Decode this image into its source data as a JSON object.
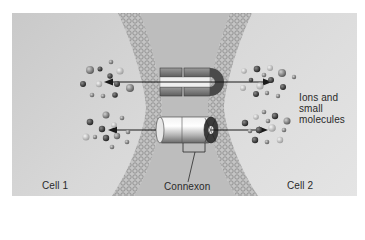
{
  "figure": {
    "labels": {
      "cell1": "Cell 1",
      "cell2": "Cell 2",
      "ions_line1": "Ions and",
      "ions_line2": "small",
      "ions_line3": "molecules",
      "connexon": "Connexon"
    },
    "components": [
      {
        "name": "left-membrane",
        "type": "lipid-bilayer"
      },
      {
        "name": "right-membrane",
        "type": "lipid-bilayer"
      },
      {
        "name": "open-channel",
        "type": "connexon-pair-cutaway"
      },
      {
        "name": "connexon-cylinder",
        "type": "connexon-pair"
      }
    ],
    "arrows": [
      {
        "from": "channel-top",
        "direction": "bidirectional"
      },
      {
        "from": "channel-bottom",
        "direction": "bidirectional"
      }
    ],
    "colors": {
      "background": "#d6d6d6",
      "intercellular_space": "#bdbdbd",
      "membrane": "#a8a8a8",
      "channel_dark": "#6e6e6e",
      "channel_light": "#d9d9d9",
      "arrow": "#1a1a1a",
      "text": "#2a2a2a"
    }
  }
}
